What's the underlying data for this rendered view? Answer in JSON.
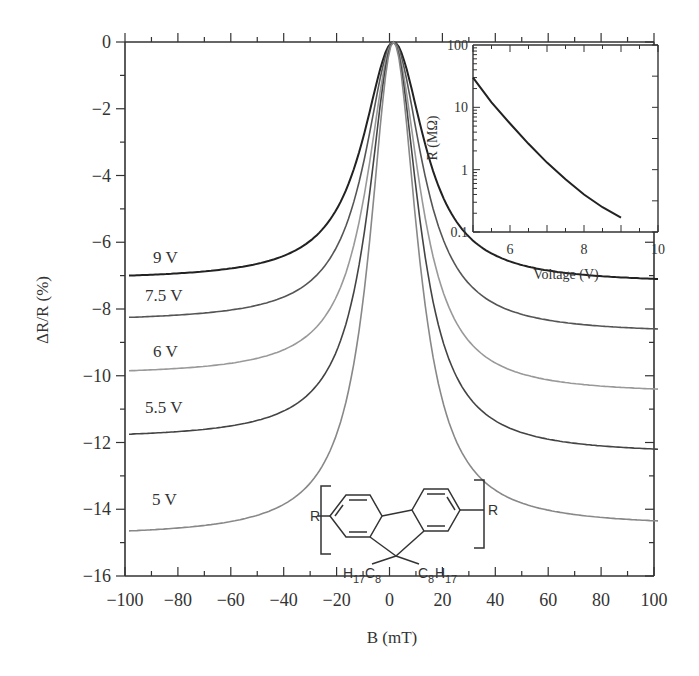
{
  "chart_data": [
    {
      "type": "line",
      "title": "",
      "xlabel": "B (mT)",
      "ylabel": "ΔR/R (%)",
      "xlim": [
        -100,
        100
      ],
      "ylim": [
        -16,
        0
      ],
      "xticks": [
        -100,
        -80,
        -60,
        -40,
        -20,
        0,
        20,
        40,
        60,
        80,
        100
      ],
      "yticks": [
        0,
        -2,
        -4,
        -6,
        -8,
        -10,
        -12,
        -14,
        -16
      ],
      "xtick_labels": [
        "−100",
        "−80",
        "−60",
        "−40",
        "−20",
        "0",
        "20",
        "40",
        "60",
        "80",
        "100"
      ],
      "ytick_labels": [
        "0",
        "−2",
        "−4",
        "−6",
        "−8",
        "−10",
        "−12",
        "−14",
        "−16"
      ],
      "grid": false,
      "legend": "inline labels",
      "x": [
        -100,
        -80,
        -60,
        -40,
        -20,
        -10,
        -5,
        0,
        5,
        10,
        20,
        40,
        60,
        80,
        100
      ],
      "series": [
        {
          "name": "9 V",
          "label": "9 V",
          "color": "#222222",
          "values": [
            -7.0,
            -6.75,
            -6.35,
            -5.65,
            -4.0,
            -2.6,
            -1.5,
            0,
            -1.5,
            -2.6,
            -4.1,
            -5.8,
            -6.5,
            -6.85,
            -7.1
          ]
        },
        {
          "name": "7.5 V",
          "label": "7.5 V",
          "color": "#555555",
          "values": [
            -8.25,
            -7.95,
            -7.45,
            -6.6,
            -4.75,
            -3.0,
            -1.7,
            0,
            -1.7,
            -3.0,
            -4.9,
            -7.0,
            -7.9,
            -8.35,
            -8.6
          ]
        },
        {
          "name": "6 V",
          "label": "6 V",
          "color": "#999999",
          "values": [
            -9.85,
            -9.45,
            -8.85,
            -7.8,
            -5.6,
            -3.5,
            -1.9,
            0,
            -1.9,
            -3.5,
            -5.8,
            -8.4,
            -9.5,
            -10.05,
            -10.4
          ]
        },
        {
          "name": "5.5 V",
          "label": "5.5 V",
          "color": "#444444",
          "values": [
            -11.75,
            -11.25,
            -10.5,
            -9.2,
            -6.5,
            -4.0,
            -2.1,
            0,
            -2.1,
            -4.0,
            -6.8,
            -9.9,
            -11.2,
            -11.85,
            -12.2
          ]
        },
        {
          "name": "5 V",
          "label": "5 V",
          "color": "#888888",
          "values": [
            -14.65,
            -13.9,
            -12.8,
            -11.0,
            -7.6,
            -4.6,
            -2.3,
            0,
            -2.3,
            -4.6,
            -7.9,
            -11.9,
            -13.3,
            -14.0,
            -14.35
          ]
        }
      ],
      "annotations": [
        {
          "text": "Chemical structure: poly(9,9-dioctylfluorene) repeat unit",
          "R_left": "R",
          "R_right": "R",
          "left_sub": "H17C8",
          "right_sub": "C8H17"
        }
      ]
    },
    {
      "type": "line",
      "title": "inset",
      "xlabel": "Voltage (V)",
      "ylabel": "R (MΩ)",
      "xlim": [
        5,
        10
      ],
      "ylim": [
        0.1,
        100
      ],
      "yscale": "log",
      "xticks": [
        6,
        8,
        10
      ],
      "yticks": [
        0.1,
        1,
        10,
        100
      ],
      "xtick_labels": [
        "6",
        "8",
        "10"
      ],
      "ytick_labels": [
        "0.1",
        "1",
        "10",
        "100"
      ],
      "grid": false,
      "x": [
        5.0,
        5.5,
        6.0,
        6.5,
        7.0,
        7.5,
        8.0,
        8.5,
        9.0
      ],
      "series": [
        {
          "name": "R vs V",
          "color": "#222222",
          "values": [
            30,
            12,
            5.5,
            2.6,
            1.3,
            0.7,
            0.4,
            0.25,
            0.17
          ]
        }
      ]
    }
  ],
  "labels": {
    "x_axis_title": "B (mT)",
    "y_axis_title": "ΔR/R (%)",
    "inset_x_title": "Voltage (V)",
    "inset_y_title": "R (MΩ)",
    "curve_9": "9 V",
    "curve_75": "7.5 V",
    "curve_6": "6 V",
    "curve_55": "5.5 V",
    "curve_5": "5 V",
    "chem_R": "R",
    "chem_left_H": "H",
    "chem_left_17": "17",
    "chem_left_C": "C",
    "chem_left_8": "8",
    "chem_right_C": "C",
    "chem_right_8": "8",
    "chem_right_H": "H",
    "chem_right_17": "17"
  }
}
